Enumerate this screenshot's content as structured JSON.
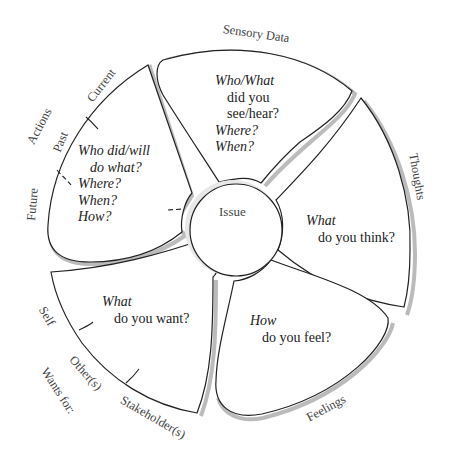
{
  "center": {
    "label": "Issue"
  },
  "petals": [
    {
      "id": "sensory",
      "category": "Sensory Data",
      "lines": [
        "Who/What",
        "did you",
        "see/hear?",
        "Where?",
        "When?"
      ]
    },
    {
      "id": "thoughts",
      "category": "Thoughts",
      "lines": [
        "What",
        "do you think?"
      ]
    },
    {
      "id": "feelings",
      "category": "Feelings",
      "lines": [
        "How",
        "do you feel?"
      ]
    },
    {
      "id": "wants",
      "category": "Wants for:",
      "sublabels": [
        "Self",
        "Other(s)",
        "Stakeholder(s)"
      ],
      "lines": [
        "What",
        "do you want?"
      ]
    },
    {
      "id": "actions",
      "category": "Actions",
      "sublabels": [
        "Current",
        "Past",
        "Future"
      ],
      "lines": [
        "Who did/will",
        "do what?",
        "Where?",
        "When?",
        "How?"
      ]
    }
  ],
  "colors": {
    "stroke": "#222222",
    "shadow": "#bbbbbb",
    "text": "#333333"
  }
}
